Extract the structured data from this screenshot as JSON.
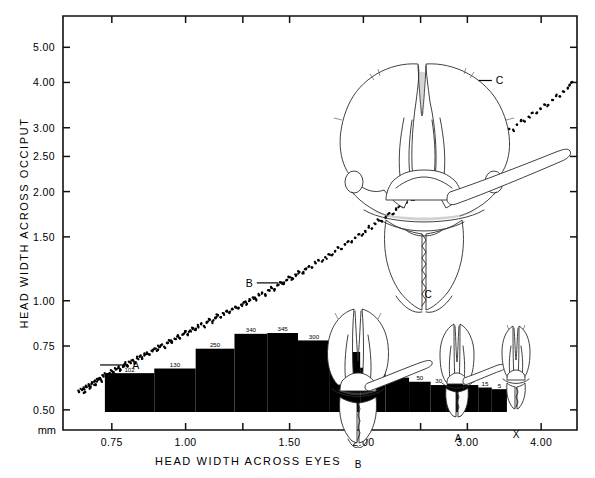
{
  "figure": {
    "kind": "scatter-with-histogram-and-illustrations",
    "background": "#ffffff",
    "ink": "#000000"
  },
  "axes": {
    "y_title": "HEAD WIDTH ACROSS OCCIPUT",
    "x_title": "HEAD WIDTH ACROSS EYES",
    "unit_label": "mm",
    "y_ticklabels": [
      "5.00",
      "4.00",
      "3.00",
      "2.50",
      "2.00",
      "1.50",
      "1.00",
      "0.75",
      "0.50"
    ],
    "y_tickvalues": [
      5.0,
      4.0,
      3.0,
      2.5,
      2.0,
      1.5,
      1.0,
      0.75,
      0.5
    ],
    "x_ticklabels": [
      "0.75",
      "1.00",
      "1.50",
      "2.00",
      "3.00",
      "4.00"
    ],
    "x_tickvalues": [
      0.75,
      1.0,
      1.5,
      2.0,
      3.0,
      4.0
    ],
    "scale": "log-log",
    "frame": "full-box-with-inward-ticks"
  },
  "chart_data": {
    "type": "scatter",
    "title": "",
    "xlabel": "HEAD WIDTH ACROSS EYES",
    "ylabel": "HEAD WIDTH ACROSS OCCIPUT",
    "units": "mm",
    "xscale": "log",
    "yscale": "log",
    "xlim": [
      0.62,
      4.6
    ],
    "ylim": [
      0.44,
      6.1
    ],
    "grid": false,
    "legend": null,
    "annotations": [
      {
        "label": "A",
        "x": 0.7,
        "y": 0.665,
        "leader_to_x": 0.8,
        "note": "minor worker caste"
      },
      {
        "label": "B",
        "x": 1.47,
        "y": 1.12,
        "leader_to_x": 1.32,
        "note": "media worker caste"
      },
      {
        "label": "C",
        "x": 2.92,
        "y": 4.05,
        "leader_to_x": 3.3,
        "note": "major worker caste"
      }
    ],
    "points": [
      [
        0.66,
        0.56
      ],
      [
        0.668,
        0.567
      ],
      [
        0.672,
        0.572
      ],
      [
        0.676,
        0.56
      ],
      [
        0.68,
        0.578
      ],
      [
        0.686,
        0.585
      ],
      [
        0.69,
        0.575
      ],
      [
        0.694,
        0.592
      ],
      [
        0.7,
        0.598
      ],
      [
        0.704,
        0.588
      ],
      [
        0.71,
        0.604
      ],
      [
        0.716,
        0.612
      ],
      [
        0.72,
        0.602
      ],
      [
        0.726,
        0.618
      ],
      [
        0.732,
        0.626
      ],
      [
        0.738,
        0.616
      ],
      [
        0.744,
        0.632
      ],
      [
        0.75,
        0.64
      ],
      [
        0.756,
        0.63
      ],
      [
        0.762,
        0.646
      ],
      [
        0.77,
        0.654
      ],
      [
        0.776,
        0.644
      ],
      [
        0.784,
        0.661
      ],
      [
        0.79,
        0.67
      ],
      [
        0.798,
        0.66
      ],
      [
        0.806,
        0.677
      ],
      [
        0.814,
        0.686
      ],
      [
        0.82,
        0.676
      ],
      [
        0.828,
        0.694
      ],
      [
        0.836,
        0.702
      ],
      [
        0.844,
        0.692
      ],
      [
        0.852,
        0.71
      ],
      [
        0.86,
        0.72
      ],
      [
        0.868,
        0.71
      ],
      [
        0.876,
        0.728
      ],
      [
        0.886,
        0.738
      ],
      [
        0.894,
        0.728
      ],
      [
        0.902,
        0.746
      ],
      [
        0.912,
        0.757
      ],
      [
        0.92,
        0.747
      ],
      [
        0.93,
        0.766
      ],
      [
        0.94,
        0.776
      ],
      [
        0.948,
        0.766
      ],
      [
        0.958,
        0.786
      ],
      [
        0.968,
        0.797
      ],
      [
        0.978,
        0.787
      ],
      [
        0.988,
        0.806
      ],
      [
        0.998,
        0.818
      ],
      [
        1.008,
        0.808
      ],
      [
        1.018,
        0.828
      ],
      [
        1.03,
        0.84
      ],
      [
        1.04,
        0.83
      ],
      [
        1.05,
        0.85
      ],
      [
        1.062,
        0.862
      ],
      [
        1.074,
        0.852
      ],
      [
        1.086,
        0.873
      ],
      [
        1.098,
        0.886
      ],
      [
        1.11,
        0.876
      ],
      [
        1.122,
        0.897
      ],
      [
        1.134,
        0.91
      ],
      [
        1.146,
        0.9
      ],
      [
        1.16,
        0.922
      ],
      [
        1.172,
        0.935
      ],
      [
        1.186,
        0.925
      ],
      [
        1.2,
        0.948
      ],
      [
        1.214,
        0.962
      ],
      [
        1.228,
        0.952
      ],
      [
        1.242,
        0.975
      ],
      [
        1.256,
        0.99
      ],
      [
        1.27,
        0.98
      ],
      [
        1.286,
        1.004
      ],
      [
        1.3,
        1.02
      ],
      [
        1.316,
        1.01
      ],
      [
        1.332,
        1.035
      ],
      [
        1.348,
        1.052
      ],
      [
        1.364,
        1.042
      ],
      [
        1.38,
        1.068
      ],
      [
        1.396,
        1.086
      ],
      [
        1.414,
        1.076
      ],
      [
        1.43,
        1.102
      ],
      [
        1.448,
        1.122
      ],
      [
        1.466,
        1.112
      ],
      [
        1.484,
        1.14
      ],
      [
        1.502,
        1.16
      ],
      [
        1.52,
        1.15
      ],
      [
        1.54,
        1.18
      ],
      [
        1.558,
        1.2
      ],
      [
        1.578,
        1.19
      ],
      [
        1.598,
        1.222
      ],
      [
        1.618,
        1.244
      ],
      [
        1.638,
        1.234
      ],
      [
        1.66,
        1.268
      ],
      [
        1.68,
        1.292
      ],
      [
        1.702,
        1.282
      ],
      [
        1.724,
        1.318
      ],
      [
        1.746,
        1.344
      ],
      [
        1.768,
        1.334
      ],
      [
        1.792,
        1.372
      ],
      [
        1.814,
        1.4
      ],
      [
        1.838,
        1.39
      ],
      [
        1.862,
        1.43
      ],
      [
        1.886,
        1.46
      ],
      [
        1.91,
        1.45
      ],
      [
        1.936,
        1.492
      ],
      [
        1.962,
        1.524
      ],
      [
        1.988,
        1.514
      ],
      [
        2.014,
        1.558
      ],
      [
        2.042,
        1.592
      ],
      [
        2.068,
        1.582
      ],
      [
        2.096,
        1.628
      ],
      [
        2.124,
        1.664
      ],
      [
        2.152,
        1.654
      ],
      [
        2.182,
        1.702
      ],
      [
        2.212,
        1.742
      ],
      [
        2.242,
        1.732
      ],
      [
        2.272,
        1.782
      ],
      [
        2.304,
        1.824
      ],
      [
        2.336,
        1.814
      ],
      [
        2.368,
        1.866
      ],
      [
        2.402,
        1.91
      ],
      [
        2.434,
        1.9
      ],
      [
        2.468,
        1.956
      ],
      [
        2.502,
        2.002
      ],
      [
        2.538,
        1.992
      ],
      [
        2.574,
        2.052
      ],
      [
        2.61,
        2.1
      ],
      [
        2.646,
        2.09
      ],
      [
        2.684,
        2.152
      ],
      [
        2.722,
        2.204
      ],
      [
        2.76,
        2.194
      ],
      [
        2.8,
        2.26
      ],
      [
        2.84,
        2.314
      ],
      [
        2.88,
        2.304
      ],
      [
        2.922,
        2.374
      ],
      [
        2.964,
        2.43
      ],
      [
        3.006,
        2.42
      ],
      [
        3.05,
        2.494
      ],
      [
        3.094,
        2.554
      ],
      [
        3.14,
        2.544
      ],
      [
        3.186,
        2.622
      ],
      [
        3.232,
        2.686
      ],
      [
        3.28,
        2.676
      ],
      [
        3.328,
        2.758
      ],
      [
        3.378,
        2.826
      ],
      [
        3.428,
        2.816
      ],
      [
        3.48,
        2.902
      ],
      [
        3.532,
        2.974
      ],
      [
        3.586,
        2.964
      ],
      [
        3.64,
        3.056
      ],
      [
        3.696,
        3.132
      ],
      [
        3.752,
        3.122
      ],
      [
        3.81,
        3.218
      ],
      [
        3.868,
        3.3
      ],
      [
        3.928,
        3.29
      ],
      [
        3.988,
        3.392
      ],
      [
        4.05,
        3.478
      ],
      [
        4.112,
        3.468
      ],
      [
        4.176,
        3.576
      ],
      [
        4.24,
        3.668
      ],
      [
        4.306,
        3.658
      ],
      [
        4.372,
        3.772
      ],
      [
        4.44,
        3.87
      ],
      [
        4.47,
        3.94
      ],
      [
        4.5,
        3.99
      ]
    ],
    "point_count_note": "dense band of individual measurements, allometric curve"
  },
  "histogram": {
    "type": "bar",
    "orientation": "vertical",
    "inset": true,
    "note": "frequency distribution of head width across eyes",
    "bars": [
      {
        "label": "102",
        "count": 102,
        "x0": 0.73,
        "x1": 0.885
      },
      {
        "label": "130",
        "count": 130,
        "x0": 0.885,
        "x1": 1.04
      },
      {
        "label": "250",
        "count": 250,
        "x0": 1.04,
        "x1": 1.21
      },
      {
        "label": "340",
        "count": 340,
        "x0": 1.21,
        "x1": 1.375
      },
      {
        "label": "345",
        "count": 345,
        "x0": 1.375,
        "x1": 1.55
      },
      {
        "label": "300",
        "count": 300,
        "x0": 1.55,
        "x1": 1.755
      },
      {
        "label": "230",
        "count": 230,
        "x0": 1.755,
        "x1": 1.975
      },
      {
        "label": "135",
        "count": 135,
        "x0": 1.975,
        "x1": 2.18
      },
      {
        "label": "75",
        "count": 75,
        "x0": 2.18,
        "x1": 2.39
      },
      {
        "label": "50",
        "count": 50,
        "x0": 2.39,
        "x1": 2.6
      },
      {
        "label": "30",
        "count": 30,
        "x0": 2.6,
        "x1": 2.77
      },
      {
        "label": "40",
        "count": 40,
        "x0": 2.77,
        "x1": 2.95
      },
      {
        "label": "30",
        "count": 30,
        "x0": 2.95,
        "x1": 3.13
      },
      {
        "label": "15",
        "count": 15,
        "x0": 3.13,
        "x1": 3.3
      },
      {
        "label": "5",
        "count": 5,
        "x0": 3.3,
        "x1": 3.5
      }
    ]
  },
  "illustrations": [
    {
      "id": "head-c",
      "label": "C",
      "caste": "major",
      "size": "large",
      "has_mandible_pointer": true
    },
    {
      "id": "head-b",
      "label": "B",
      "caste": "media",
      "size": "medium",
      "has_mandible_pointer": true
    },
    {
      "id": "head-a",
      "label": "A",
      "caste": "minor",
      "size": "small",
      "has_mandible_pointer": true
    },
    {
      "id": "head-x",
      "label": "X",
      "caste": "minim",
      "size": "smallest",
      "has_mandible_pointer": false
    }
  ]
}
